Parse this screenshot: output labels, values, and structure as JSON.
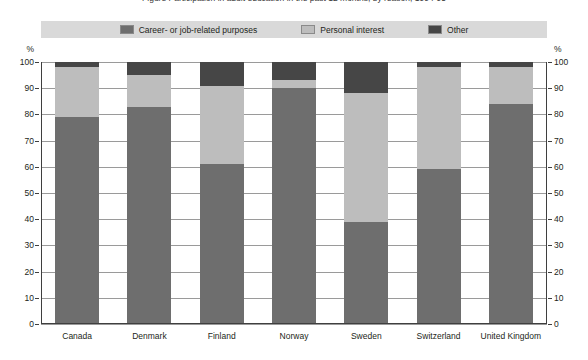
{
  "chart_data": {
    "type": "bar",
    "subtype": "stacked-column-100",
    "title": "Figure     Participation in adult education in the past 12 months, by reason, 1994-95",
    "xlabel": "",
    "ylabel": "%",
    "ylim": [
      0,
      100
    ],
    "ytick_step": 10,
    "yticks": [
      "100",
      "90",
      "80",
      "70",
      "60",
      "50",
      "40",
      "30",
      "20",
      "10",
      "0"
    ],
    "grid": true,
    "legend_position": "top",
    "axis_unit_left": "%",
    "axis_unit_right": "%",
    "categories": [
      "Canada",
      "Denmark",
      "Finland",
      "Norway",
      "Sweden",
      "Switzerland",
      "United Kingdom"
    ],
    "series": [
      {
        "name": "Career- or job-related purposes",
        "color": "#6e6e6e",
        "values": [
          79,
          83,
          61,
          90,
          39,
          59,
          84
        ]
      },
      {
        "name": "Personal interest",
        "color": "#bdbdbd",
        "values": [
          19,
          12,
          30,
          3,
          49,
          39,
          14
        ]
      },
      {
        "name": "Other",
        "color": "#464646",
        "values": [
          2,
          5,
          9,
          7,
          12,
          2,
          2
        ]
      }
    ]
  },
  "legend": {
    "items": [
      {
        "label": "Career- or job-related purposes",
        "color": "#6e6e6e"
      },
      {
        "label": "Personal interest",
        "color": "#bdbdbd"
      },
      {
        "label": "Other",
        "color": "#464646"
      }
    ]
  }
}
